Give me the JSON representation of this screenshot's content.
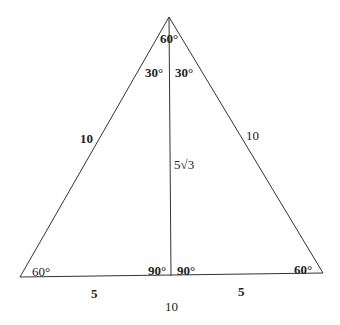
{
  "diagram": {
    "angles": {
      "apex": "60°",
      "apex_left": "30°",
      "apex_right": "30°",
      "bottom_left": "60°",
      "foot_left": "90°",
      "foot_right": "90°",
      "bottom_right": "60°"
    },
    "sides": {
      "left_side": "10",
      "right_side": "10",
      "altitude": "5√3",
      "base_left_half": "5",
      "base_right_half": "5",
      "base_total": "10"
    }
  }
}
